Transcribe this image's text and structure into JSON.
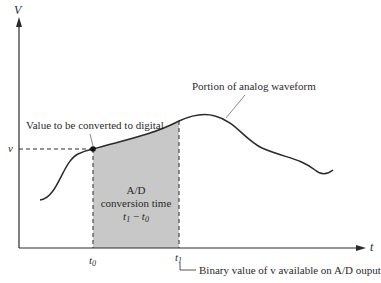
{
  "diagram": {
    "axes": {
      "y_label": "V",
      "x_label": "t"
    },
    "ticks": {
      "t0": {
        "symbol": "t",
        "sub": "0"
      },
      "t1": {
        "symbol": "t",
        "sub": "1"
      }
    },
    "level_label": "v",
    "annotations": {
      "value_to_convert": "Value to be converted to digital",
      "waveform": "Portion of analog waveform",
      "binary_value": "Binary value of v available on A/D ouput"
    },
    "shaded_region": {
      "line1": "A/D",
      "line2": "conversion time",
      "expr": {
        "a": "t",
        "a_sub": "1",
        "op": "−",
        "b": "t",
        "b_sub": "0"
      }
    },
    "colors": {
      "curve": "#2a2a2a",
      "shade": "#c8c8c8",
      "axis": "#2a2a2a",
      "leader": "#555555"
    }
  }
}
